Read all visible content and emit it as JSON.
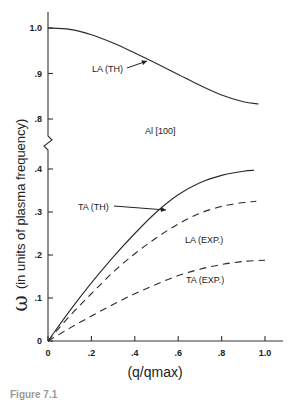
{
  "chart_data": {
    "type": "line",
    "title": "",
    "subtitle": "Al [100]",
    "xlabel": "(q/qmax)",
    "ylabel": "ω (in units of plasma frequency)",
    "xlim": [
      0,
      1.0
    ],
    "ylim": [
      0,
      1.0
    ],
    "axis_break": {
      "between": [
        0.4,
        0.8
      ]
    },
    "x_ticks": [
      "0",
      ".2",
      ".4",
      ".6",
      ".8",
      "1.0"
    ],
    "y_ticks": [
      "0",
      ".1",
      ".2",
      ".3",
      ".4",
      ".8",
      ".9",
      "1.0"
    ],
    "grid": false,
    "legend": "inline annotations",
    "series": [
      {
        "name": "LA (TH)",
        "style": "solid",
        "x": [
          0,
          0.1,
          0.2,
          0.3,
          0.4,
          0.5,
          0.6,
          0.7,
          0.8,
          0.9,
          0.97
        ],
        "y": [
          1.0,
          0.997,
          0.985,
          0.967,
          0.945,
          0.922,
          0.898,
          0.874,
          0.853,
          0.838,
          0.833
        ]
      },
      {
        "name": "TA (TH)",
        "style": "solid",
        "x": [
          0,
          0.1,
          0.2,
          0.3,
          0.4,
          0.5,
          0.6,
          0.7,
          0.8,
          0.9,
          0.95
        ],
        "y": [
          0,
          0.07,
          0.135,
          0.195,
          0.25,
          0.3,
          0.34,
          0.368,
          0.385,
          0.395,
          0.397
        ]
      },
      {
        "name": "LA (EXP)",
        "style": "dashed",
        "x": [
          0,
          0.1,
          0.2,
          0.3,
          0.4,
          0.5,
          0.6,
          0.7,
          0.8,
          0.9,
          0.96
        ],
        "y": [
          0,
          0.058,
          0.11,
          0.16,
          0.203,
          0.24,
          0.272,
          0.297,
          0.313,
          0.322,
          0.325
        ]
      },
      {
        "name": "TA (EXP)",
        "style": "dashed",
        "x": [
          0,
          0.1,
          0.2,
          0.3,
          0.4,
          0.5,
          0.6,
          0.7,
          0.8,
          0.9,
          1.0
        ],
        "y": [
          0,
          0.03,
          0.058,
          0.085,
          0.11,
          0.132,
          0.152,
          0.167,
          0.178,
          0.185,
          0.188
        ]
      }
    ],
    "annotations": [
      {
        "text": "LA (TH)",
        "arrow": true
      },
      {
        "text": "TA (TH)",
        "arrow": true
      },
      {
        "text": "LA (EXP.)",
        "arrow": false
      },
      {
        "text": "TA (EXP.)",
        "arrow": false
      },
      {
        "text": "Al [100]",
        "arrow": false
      }
    ]
  },
  "labels": {
    "ylabel_symbol": "ω",
    "ylabel_text": "(in units of plasma frequency)",
    "xlabel": "(q/qmax)",
    "caption": "Figure 7.1"
  }
}
